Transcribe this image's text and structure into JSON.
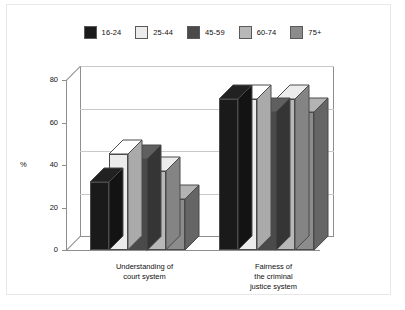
{
  "chart_data": {
    "type": "bar",
    "title": "",
    "subtitle": "",
    "xlabel": "",
    "ylabel": "%",
    "ylim": [
      0,
      80
    ],
    "yticks": [
      0,
      20,
      40,
      60,
      80
    ],
    "grid": true,
    "legend_position": "top",
    "style": "3d-grouped-bar",
    "categories": [
      "Understanding of\ncourt system",
      "Fairness of\nthe criminal\njustice system"
    ],
    "category_lines": [
      [
        "Understanding of",
        "court system"
      ],
      [
        "Fairness of",
        "the criminal",
        "justice system"
      ]
    ],
    "series": [
      {
        "name": "16-24",
        "color": "#1a1a1a",
        "values": [
          32,
          71
        ]
      },
      {
        "name": "25-44",
        "color": "#ececec",
        "values": [
          45,
          71
        ]
      },
      {
        "name": "45-59",
        "color": "#4a4a4a",
        "values": [
          43,
          65
        ]
      },
      {
        "name": "60-74",
        "color": "#b8b8b8",
        "values": [
          37,
          71
        ]
      },
      {
        "name": "75+",
        "color": "#8c8c8c",
        "values": [
          24,
          65
        ]
      }
    ]
  },
  "legend": {
    "items": [
      {
        "label": "16-24",
        "color": "#1a1a1a"
      },
      {
        "label": "25-44",
        "color": "#ececec"
      },
      {
        "label": "45-59",
        "color": "#4a4a4a"
      },
      {
        "label": "60-74",
        "color": "#b8b8b8"
      },
      {
        "label": "75+",
        "color": "#8c8c8c"
      }
    ]
  },
  "axis": {
    "y_label": "%",
    "y_ticks": [
      "0",
      "20",
      "40",
      "60",
      "80"
    ]
  }
}
